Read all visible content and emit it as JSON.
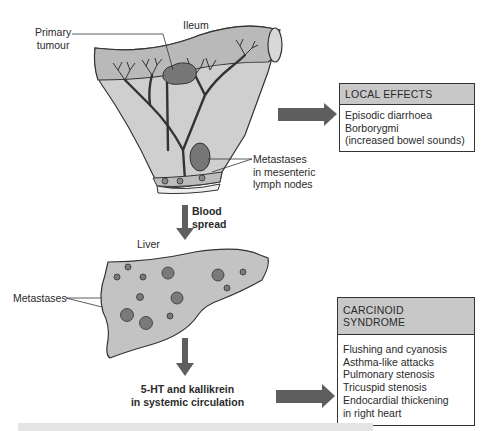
{
  "labels": {
    "ileum": "Ileum",
    "primary_tumour_line1": "Primary",
    "primary_tumour_line2": "tumour",
    "metastases_nodes_line1": "Metastases",
    "metastases_nodes_line2": "in mesenteric",
    "metastases_nodes_line3": "lymph nodes",
    "blood_spread_line1": "Blood",
    "blood_spread_line2": "spread",
    "liver": "Liver",
    "metastases_liver": "Metastases",
    "circulation_line1": "5-HT and kallikrein",
    "circulation_line2": "in systemic circulation"
  },
  "local_effects": {
    "title": "LOCAL EFFECTS",
    "items": [
      "Episodic diarrhoea",
      "Borborygmi",
      "(increased bowel sounds)"
    ]
  },
  "carcinoid_syndrome": {
    "title": "CARCINOID SYNDROME",
    "items": [
      "Flushing and cyanosis",
      "Asthma-like attacks",
      "Pulmonary stenosis",
      "Tricuspid stenosis",
      "Endocardial thickening",
      "in right heart"
    ]
  },
  "colors": {
    "tissue": "#c9c9c9",
    "tissue_dark": "#b5b5b5",
    "arrow": "#5e5e5e",
    "box_header": "#c8c8c8"
  }
}
